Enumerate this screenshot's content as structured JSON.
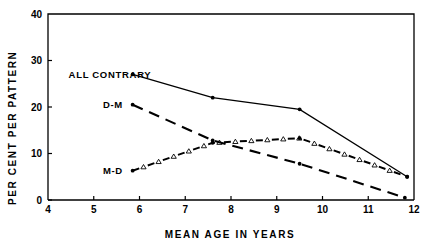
{
  "chart_data": {
    "type": "line",
    "title": "",
    "xlabel": "MEAN AGE IN YEARS",
    "ylabel": "PER CENT PER PATTERN",
    "xlim": [
      4,
      12
    ],
    "ylim": [
      0,
      40
    ],
    "xticks": [
      4,
      5,
      6,
      7,
      8,
      9,
      10,
      11,
      12
    ],
    "xticklabels": [
      "4",
      "5",
      "6",
      "7",
      "8",
      "9",
      "10",
      "11",
      "12"
    ],
    "yticks": [
      0,
      10,
      20,
      30,
      40
    ],
    "yticklabels": [
      "0",
      "10",
      "20",
      "30",
      "40"
    ],
    "grid": false,
    "legend_position": "inline-annotations",
    "series": [
      {
        "name": "ALL CONTRARY",
        "label": "ALL CONTRARY",
        "linestyle": "solid",
        "marker": "dot",
        "color": "#000000",
        "x": [
          5.85,
          7.6,
          9.5,
          11.85
        ],
        "y": [
          27.0,
          22.0,
          19.5,
          5.0
        ],
        "label_x": 4.45,
        "label_y": 27.0
      },
      {
        "name": "D-M",
        "label": "D-M",
        "linestyle": "long-dash",
        "marker": "dot",
        "color": "#000000",
        "x": [
          5.85,
          7.6,
          9.5,
          11.8
        ],
        "y": [
          20.5,
          12.8,
          7.8,
          0.5
        ],
        "label_x": 5.2,
        "label_y": 20.5
      },
      {
        "name": "M-D",
        "label": "M-D",
        "linestyle": "dash-dot-triangle",
        "marker": "triangle",
        "color": "#000000",
        "x": [
          5.85,
          7.6,
          9.5,
          11.85
        ],
        "y": [
          6.3,
          12.3,
          13.3,
          5.0
        ],
        "label_x": 5.2,
        "label_y": 6.3
      }
    ]
  }
}
